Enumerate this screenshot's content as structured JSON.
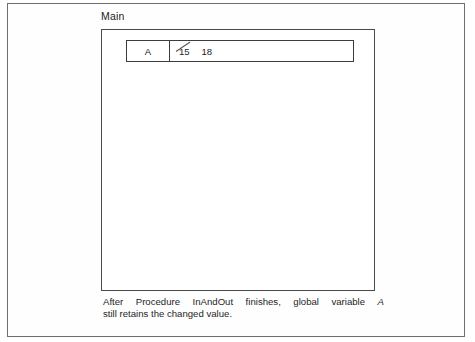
{
  "figure": {
    "main_label": "Main",
    "variable_table": {
      "name_cell": "A",
      "old_value": "15",
      "new_value": "18"
    },
    "caption": {
      "line1_before_var": "After Procedure InAndOut finishes, global variable",
      "line1_var": "A",
      "line2": "still retains the changed value."
    }
  },
  "colors": {
    "page_background": "#ffffff",
    "outer_frame_border": "#6e6e6e",
    "main_box_border": "#4a4a4a",
    "table_border": "#3c3c3c",
    "text": "#1e1e1e",
    "strikethrough": "#555555"
  }
}
